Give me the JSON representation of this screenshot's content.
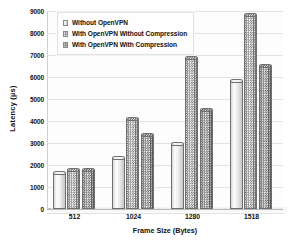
{
  "chart_data": {
    "type": "bar",
    "title": "",
    "xlabel": "Frame Size (Bytes)",
    "ylabel": "Latency (µs)",
    "categories": [
      "512",
      "1024",
      "1280",
      "1518"
    ],
    "series": [
      {
        "name": "Without OpenVPN",
        "values": [
          1650,
          2300,
          2950,
          5800
        ]
      },
      {
        "name": "With OpenVPN Without Compression",
        "values": [
          1780,
          4100,
          6850,
          8800
        ]
      },
      {
        "name": "With OpenVPN With Compression",
        "values": [
          1780,
          3350,
          4500,
          6500
        ]
      }
    ],
    "ylim": [
      0,
      9000
    ],
    "yticks": [
      0,
      1000,
      2000,
      3000,
      4000,
      5000,
      6000,
      7000,
      8000,
      9000
    ],
    "ytick_labels": [
      "0",
      "1000",
      "2000",
      "3000",
      "4000",
      "5000",
      "6000",
      "7000",
      "8000",
      "9000"
    ],
    "grid": true,
    "legend_position": "top-left",
    "legend": [
      "Without OpenVPN",
      "With OpenVPN Without Compression",
      "With OpenVPN With Compression"
    ],
    "colors": {
      "series_1": "#f1f1f1",
      "series_2": "#d8d8d8",
      "series_3": "#bdbdbd",
      "gridline": "#e3e3e3",
      "axis": "#b9b9b9",
      "text": "#111111",
      "background": "#ffffff"
    }
  }
}
